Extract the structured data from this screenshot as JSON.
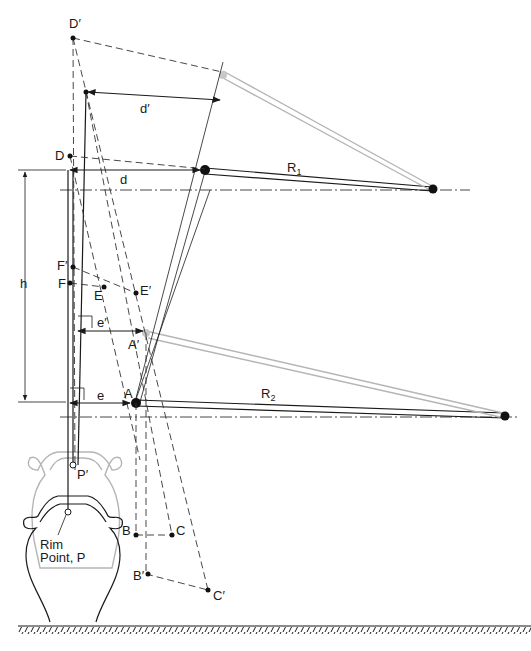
{
  "figure": {
    "colors": {
      "ink": "#1a1a1a",
      "ghost": "#b5b5b5",
      "background": "#ffffff"
    }
  },
  "labels": {
    "D_prime": "D′",
    "D": "D",
    "d_prime": "d′",
    "d": "d",
    "R1": "R",
    "R1_sub": "1",
    "R2": "R",
    "R2_sub": "2",
    "h": "h",
    "F_prime": "F′",
    "F": "F",
    "E": "E",
    "E_prime": "E′",
    "e_prime": "e′",
    "A_prime": "A′",
    "e": "e",
    "A": "A",
    "P_prime": "P′",
    "rim_point_line1": "Rim",
    "rim_point_line2": "Point, P",
    "B": "B",
    "C": "C",
    "B_prime": "B′",
    "C_prime": "C′"
  },
  "elements": {
    "upper_arm": "R1 link (dark, lowered position) and ghost link (raised position)",
    "lower_arm": "R2 link (dark, lowered position) and ghost link (raised position)",
    "pot_lowered": "Pot resting on ground with rim point P",
    "pot_raised": "Ghost pot outline with rim point P′",
    "ground": "Hatched ground line"
  }
}
